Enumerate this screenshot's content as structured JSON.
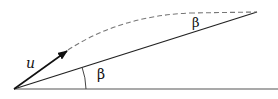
{
  "diagram": {
    "labels": {
      "velocity": "u",
      "incline_angle": "β",
      "apex_angle": "β"
    },
    "colors": {
      "stroke": "#222222",
      "dashed": "#777777",
      "background": "#ffffff"
    }
  }
}
